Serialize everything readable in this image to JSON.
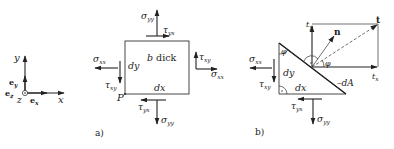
{
  "coordinate_system": {
    "axis_y": "y",
    "axis_x": "x",
    "axis_z": "z",
    "unit_y": "e",
    "unit_y_sub": "y",
    "unit_x": "e",
    "unit_x_sub": "x",
    "unit_z": "e",
    "unit_z_sub": "z"
  },
  "diagram_a": {
    "caption": "a)",
    "thickness_label": "b dick",
    "dx": "dx",
    "dy": "dy",
    "point": "P",
    "sigma_yy_top": {
      "sym": "σ",
      "sub": "yy"
    },
    "tau_yx_top": {
      "sym": "τ",
      "sub": "yx"
    },
    "sigma_xx_left": {
      "sym": "σ",
      "sub": "xx"
    },
    "tau_xy_left": {
      "sym": "τ",
      "sub": "xy"
    },
    "tau_xy_right": {
      "sym": "τ",
      "sub": "xy"
    },
    "sigma_xx_right": {
      "sym": "σ",
      "sub": "xx"
    },
    "tau_yx_bottom": {
      "sym": "τ",
      "sub": "yx"
    },
    "sigma_yy_bottom": {
      "sym": "σ",
      "sub": "yy"
    }
  },
  "diagram_b": {
    "caption": "b)",
    "dx": "dx",
    "dy": "dy",
    "dA": "dA",
    "phi_top": "φ",
    "phi_right": "φ",
    "t": "t",
    "n": "n",
    "t_y": {
      "sym": "t",
      "sub": "y"
    },
    "t_x": {
      "sym": "t",
      "sub": "x"
    },
    "sigma_xx": {
      "sym": "σ",
      "sub": "xx"
    },
    "tau_xy": {
      "sym": "τ",
      "sub": "xy"
    },
    "tau_yx": {
      "sym": "τ",
      "sub": "yx"
    },
    "sigma_yy": {
      "sym": "σ",
      "sub": "yy"
    }
  }
}
